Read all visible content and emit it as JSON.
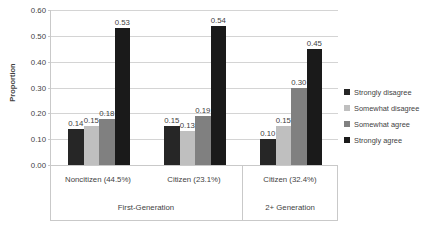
{
  "chart_data": {
    "type": "bar",
    "title": "",
    "xlabel": "",
    "ylabel": "Proportion",
    "ylim": [
      0,
      0.6
    ],
    "ytick_step": 0.1,
    "ytick_labels": [
      "0.00",
      "0.10",
      "0.20",
      "0.30",
      "0.40",
      "0.50",
      "0.60"
    ],
    "ytick_values": [
      0,
      0.1,
      0.2,
      0.3,
      0.4,
      0.5,
      0.6
    ],
    "grid": true,
    "legend_position": "right",
    "categories": [
      "Noncitizen (44.5%)",
      "Citizen (23.1%)",
      "Citizen (32.4%)"
    ],
    "group_tiers": [
      {
        "label": "First-Generation",
        "span": 2
      },
      {
        "label": "2+ Generation",
        "span": 1
      }
    ],
    "series": [
      {
        "name": "Strongly disagree",
        "color": "#262626",
        "values": [
          0.14,
          0.15,
          0.1
        ],
        "labels": [
          "0.14",
          "0.15",
          "0.10"
        ]
      },
      {
        "name": "Somewhat disagree",
        "color": "#bfbfbf",
        "values": [
          0.15,
          0.13,
          0.15
        ],
        "labels": [
          "0.15",
          "0.13",
          "0.15"
        ]
      },
      {
        "name": "Somewhat agree",
        "color": "#808080",
        "values": [
          0.18,
          0.19,
          0.3
        ],
        "labels": [
          "0.18",
          "0.19",
          "0.30"
        ]
      },
      {
        "name": "Strongly agree",
        "color": "#1a1a1a",
        "values": [
          0.53,
          0.54,
          0.45
        ],
        "labels": [
          "0.53",
          "0.54",
          "0.45"
        ]
      }
    ]
  }
}
